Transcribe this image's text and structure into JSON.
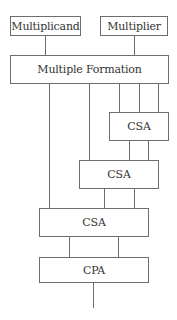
{
  "diagram": {
    "colors": {
      "line": "#6e6e6e",
      "text": "#333333",
      "background": "#ffffff"
    },
    "boxes": {
      "multiplicand": {
        "label": "Multiplicand"
      },
      "multiplier": {
        "label": "Multiplier"
      },
      "multiple_formation": {
        "label": "Multiple Formation"
      },
      "csa1": {
        "label": "CSA"
      },
      "csa2": {
        "label": "CSA"
      },
      "csa3": {
        "label": "CSA"
      },
      "cpa": {
        "label": "CPA"
      }
    },
    "connections": [
      {
        "from": "multiplicand",
        "to": "multiple_formation",
        "count": 1
      },
      {
        "from": "multiplier",
        "to": "multiple_formation",
        "count": 1
      },
      {
        "from": "multiple_formation",
        "to": "csa1",
        "count": 3
      },
      {
        "from": "multiple_formation",
        "to": "csa2",
        "count": 1
      },
      {
        "from": "multiple_formation",
        "to": "csa3",
        "count": 1
      },
      {
        "from": "csa1",
        "to": "csa2",
        "count": 2
      },
      {
        "from": "csa2",
        "to": "csa3",
        "count": 2
      },
      {
        "from": "csa3",
        "to": "cpa",
        "count": 2
      },
      {
        "from": "cpa",
        "to": "output",
        "count": 1
      }
    ]
  }
}
